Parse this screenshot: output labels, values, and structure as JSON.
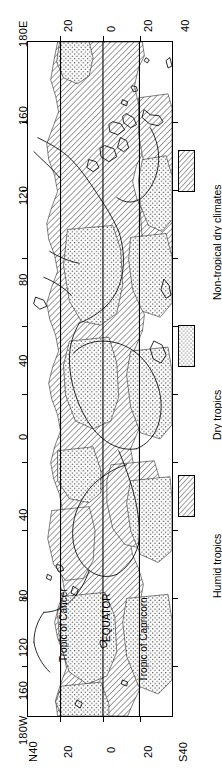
{
  "figure": {
    "type": "map",
    "orientation": "rotated-90"
  },
  "axes": {
    "longitude_axis_name": "longitude",
    "latitude_axis_name": "latitude",
    "longitude_ticks": [
      "180E",
      "160",
      "120",
      "80",
      "40",
      "0",
      "40",
      "80",
      "120",
      "160",
      "180W"
    ],
    "latitude_ticks_top": [
      "20",
      "0",
      "20",
      "40"
    ],
    "latitude_ticks_bottom": [
      "N40",
      "20",
      "0",
      "20",
      "S40"
    ]
  },
  "annotations": [
    {
      "id": "tropic-of-cancer",
      "label": "Tropic of Cancer"
    },
    {
      "id": "equator",
      "label": "EQUATOR"
    },
    {
      "id": "tropic-of-capricorn",
      "label": "Tropic of Capricorn"
    }
  ],
  "legend": {
    "items": [
      {
        "id": "non-tropical-dry-climates",
        "label": "Non-tropical dry climates",
        "pattern": "diagonal-hatch"
      },
      {
        "id": "dry-tropics",
        "label": "Dry tropics",
        "pattern": "stipple-dots"
      },
      {
        "id": "humid-tropics",
        "label": "Humid tropics",
        "pattern": "diagonal-hatch"
      }
    ]
  },
  "colors": {
    "ink": "#000000",
    "paper": "#ffffff"
  }
}
